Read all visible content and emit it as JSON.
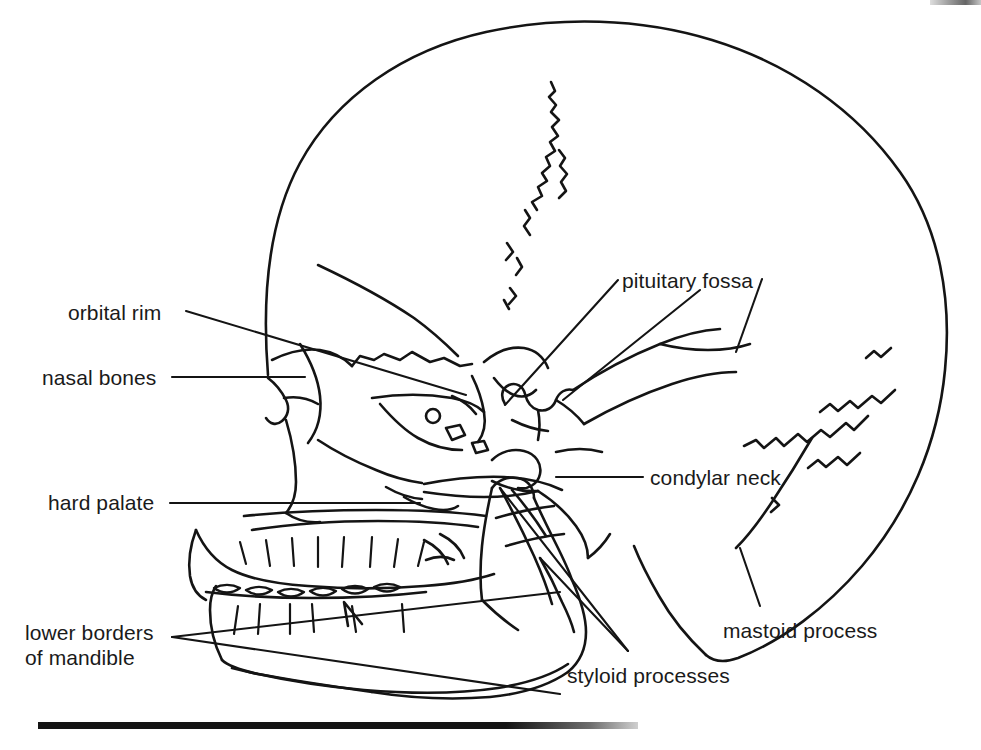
{
  "figure": {
    "ink_color": "#141414",
    "background_color": "#ffffff",
    "stroke_width": 2.5
  },
  "labels": [
    {
      "id": "orbital-rim",
      "text": "orbital rim",
      "x": 68,
      "y": 300
    },
    {
      "id": "nasal-bones",
      "text": "nasal bones",
      "x": 42,
      "y": 365
    },
    {
      "id": "hard-palate",
      "text": "hard palate",
      "x": 48,
      "y": 490
    },
    {
      "id": "lower-borders",
      "text": "lower borders",
      "x": 25,
      "y": 620
    },
    {
      "id": "of-mandible",
      "text": "of mandible",
      "x": 25,
      "y": 645
    },
    {
      "id": "pituitary-fossa",
      "text": "pituitary fossa",
      "x": 622,
      "y": 268
    },
    {
      "id": "condylar-neck",
      "text": "condylar neck",
      "x": 650,
      "y": 465
    },
    {
      "id": "mastoid-process",
      "text": "mastoid process",
      "x": 723,
      "y": 618
    },
    {
      "id": "styloid-processes",
      "text": "styloid processes",
      "x": 567,
      "y": 663
    }
  ],
  "leader_lines": [
    {
      "id": "orbital-rim-leader",
      "from": [
        186,
        311
      ],
      "to": [
        466,
        395
      ]
    },
    {
      "id": "nasal-bones-leader",
      "from": [
        172,
        377
      ],
      "to": [
        305,
        377
      ]
    },
    {
      "id": "hard-palate-leader",
      "from": [
        170,
        503
      ],
      "to": [
        420,
        503
      ]
    },
    {
      "id": "mandible-leader-1",
      "from": [
        172,
        637
      ],
      "to": [
        560,
        592
      ]
    },
    {
      "id": "mandible-leader-2",
      "from": [
        172,
        637
      ],
      "to": [
        560,
        694
      ]
    },
    {
      "id": "pituitary-leader-1",
      "from": [
        618,
        280
      ],
      "to": [
        505,
        405
      ]
    },
    {
      "id": "pituitary-leader-2",
      "from": [
        700,
        290
      ],
      "to": [
        563,
        400
      ]
    },
    {
      "id": "pituitary-leader-3",
      "from": [
        760,
        279
      ],
      "to": [
        735,
        352
      ]
    },
    {
      "id": "condylar-leader",
      "from": [
        643,
        477
      ],
      "to": [
        556,
        477
      ]
    },
    {
      "id": "mastoid-leader",
      "from": [
        760,
        606
      ],
      "to": [
        740,
        548
      ]
    },
    {
      "id": "styloid-leader-1",
      "from": [
        628,
        651
      ],
      "to": [
        540,
        558
      ]
    },
    {
      "id": "styloid-leader-2",
      "from": [
        628,
        651
      ],
      "to": [
        500,
        488
      ]
    }
  ],
  "anatomy_parts": [
    "cranial-vault",
    "coronal-suture",
    "lambdoid-suture",
    "frontal-bone",
    "orbit",
    "nasal-bones",
    "zygomatic-arch",
    "maxilla",
    "upper-teeth",
    "lower-teeth",
    "mandible-body",
    "mandibular-ramus",
    "condylar-neck",
    "styloid-processes",
    "mastoid-process",
    "pituitary-fossa",
    "hard-palate",
    "petrous-temporal",
    "occipital-bone"
  ]
}
